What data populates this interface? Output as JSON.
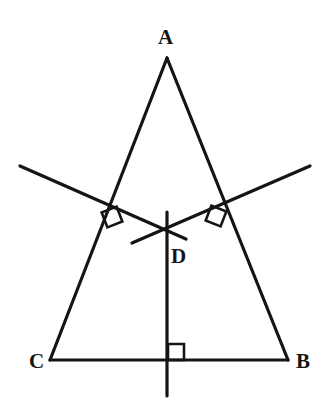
{
  "figure": {
    "type": "geometry-diagram",
    "canvas": {
      "width": 326,
      "height": 416,
      "background": "#ffffff"
    },
    "stroke": {
      "color": "#151515",
      "width": 3.2,
      "marker_width": 2.6
    },
    "points": {
      "A": {
        "label": "A",
        "x": 167,
        "y": 58,
        "label_x": 165,
        "label_y": 38
      },
      "B": {
        "label": "B",
        "x": 288,
        "y": 360,
        "label_x": 303,
        "label_y": 362
      },
      "C": {
        "label": "C",
        "x": 50,
        "y": 360,
        "label_x": 36,
        "label_y": 362
      },
      "D": {
        "label": "D",
        "x": 167,
        "y": 230,
        "label_x": 178,
        "label_y": 257
      }
    },
    "segments": [
      {
        "name": "side-AC",
        "x1": 167,
        "y1": 58,
        "x2": 50,
        "y2": 360
      },
      {
        "name": "side-AB",
        "x1": 167,
        "y1": 58,
        "x2": 288,
        "y2": 360
      },
      {
        "name": "side-CB",
        "x1": 50,
        "y1": 360,
        "x2": 288,
        "y2": 360
      },
      {
        "name": "bisector-left",
        "x1": 20,
        "y1": 166,
        "x2": 186,
        "y2": 239
      },
      {
        "name": "bisector-right",
        "x1": 310,
        "y1": 166,
        "x2": 132,
        "y2": 243
      },
      {
        "name": "bisector-vertical",
        "x1": 167,
        "y1": 212,
        "x2": 167,
        "y2": 396
      }
    ],
    "right_angle_markers": [
      {
        "name": "right-angle-on-AC",
        "cx": 112,
        "cy": 217,
        "size": 16,
        "rotation": -21
      },
      {
        "name": "right-angle-on-AB",
        "cx": 216,
        "cy": 216,
        "size": 16,
        "rotation": 21
      },
      {
        "name": "right-angle-on-CB",
        "cx": 176,
        "cy": 352,
        "size": 16,
        "rotation": 0
      }
    ]
  }
}
